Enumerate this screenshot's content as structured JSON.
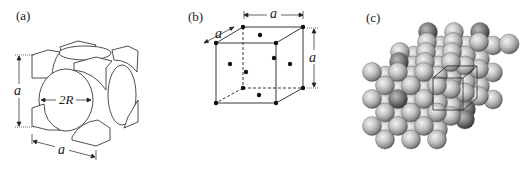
{
  "figure": {
    "panels": [
      {
        "id": "a",
        "label": "(a)",
        "description": "Hard-sphere unit cell of FCC showing corner atom octants and face-centered half spheres",
        "dimension_labels": {
          "vertical_edge": "a",
          "horizontal_edge": "a",
          "sphere_diameter": "2R"
        }
      },
      {
        "id": "b",
        "label": "(b)",
        "description": "Reduced-sphere FCC unit cell with atoms at cube corners and face centers",
        "dimension_labels": {
          "top_edge": "a",
          "depth_edge": "a",
          "right_edge": "a"
        },
        "corner_atoms": 8,
        "face_center_atoms": 6
      },
      {
        "id": "c",
        "label": "(c)",
        "description": "Aggregate of many atoms in an FCC crystal with one unit cell outlined"
      }
    ]
  },
  "colors": {
    "line": "#222222",
    "atom_dot": "#111111",
    "sphere_light": "#e8e8e8",
    "sphere_mid": "#a8a8a8",
    "sphere_dark": "#4a4a4a"
  }
}
